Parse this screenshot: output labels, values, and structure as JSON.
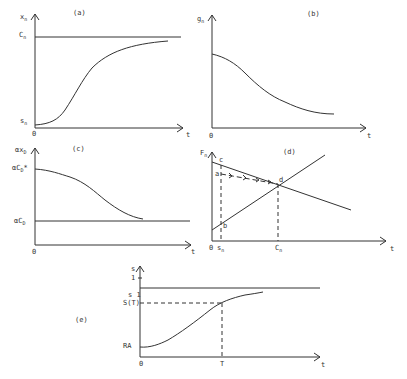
{
  "panels": {
    "a": {
      "title": "(a)",
      "y_label": "x",
      "y_label_sub": "n",
      "x_label": "t",
      "origin": "0",
      "upper_level_label": "C",
      "upper_level_sub": "n",
      "start_label": "s",
      "start_label_sub": "n"
    },
    "b": {
      "title": "(b)",
      "y_label": "g",
      "y_label_sub": "n",
      "x_label": "t",
      "origin": "0"
    },
    "c": {
      "title": "(c)",
      "y_label": "αx",
      "y_label_sub": "D",
      "x_label": "t",
      "origin": "0",
      "upper_label": "αC",
      "upper_label_sub": "D",
      "upper_label_sup": "*",
      "lower_label": "αC",
      "lower_label_sub": "D"
    },
    "d": {
      "title": "(d)",
      "y_label": "F",
      "y_label_sub": "n",
      "x_label": "t",
      "origin": "0",
      "point_c": "c",
      "point_a": "a",
      "point_b": "b",
      "point_d": "d",
      "x_tick_1": "s",
      "x_tick_1_sub": "n",
      "x_tick_2": "C",
      "x_tick_2_sub": "n"
    },
    "e": {
      "title": "(e)",
      "y_label": "s",
      "y_tick_1": "1",
      "level_label": "s 1",
      "st_label": "S(T)",
      "start_label": "RA",
      "x_label": "t",
      "origin": "0",
      "x_tick_T": "T"
    }
  },
  "colors": {
    "ink": "#333333",
    "background": "#ffffff"
  }
}
